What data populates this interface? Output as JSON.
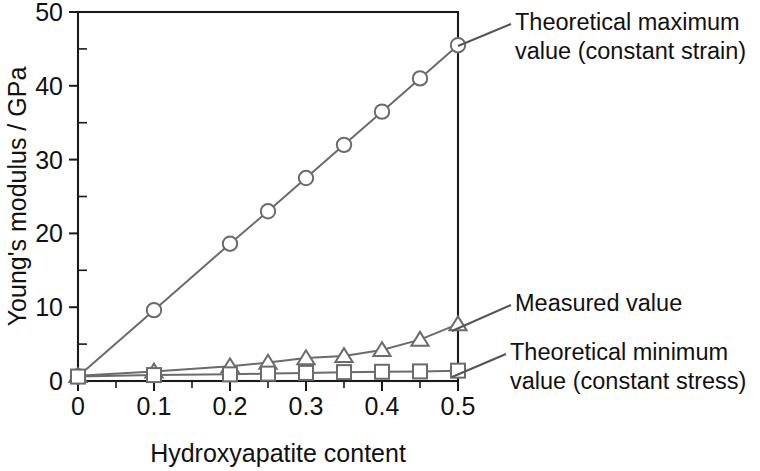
{
  "chart_data": {
    "type": "line",
    "title": "",
    "xlabel": "Hydroxyapatite content",
    "ylabel": "Young's modulus / GPa",
    "xlim": [
      0,
      0.5
    ],
    "ylim": [
      0,
      50
    ],
    "xticks": [
      "0",
      "0.1",
      "0.2",
      "0.3",
      "0.4",
      "0.5"
    ],
    "xtick_values": [
      0,
      0.1,
      0.2,
      0.3,
      0.4,
      0.5
    ],
    "xminor_step": 0.05,
    "yticks": [
      "0",
      "10",
      "20",
      "30",
      "40",
      "50"
    ],
    "ytick_values": [
      0,
      10,
      20,
      30,
      40,
      50
    ],
    "yminor_step": 5,
    "grid": false,
    "legend_position": "annotations-right",
    "series": [
      {
        "name": "Theoretical maximum value (constant strain)",
        "marker": "circle",
        "x": [
          0,
          0.1,
          0.2,
          0.25,
          0.3,
          0.35,
          0.4,
          0.45,
          0.5
        ],
        "values": [
          0.6,
          9.6,
          18.6,
          23.0,
          27.5,
          32.0,
          36.5,
          41.0,
          45.5
        ]
      },
      {
        "name": "Measured value",
        "marker": "triangle",
        "x": [
          0,
          0.1,
          0.2,
          0.25,
          0.3,
          0.35,
          0.4,
          0.45,
          0.5
        ],
        "values": [
          0.7,
          1.3,
          2.0,
          2.5,
          3.1,
          3.4,
          4.2,
          5.6,
          7.7
        ]
      },
      {
        "name": "Theoretical minimum value (constant stress)",
        "marker": "square",
        "x": [
          0,
          0.1,
          0.2,
          0.25,
          0.3,
          0.35,
          0.4,
          0.45,
          0.5
        ],
        "values": [
          0.6,
          0.8,
          0.9,
          1.0,
          1.1,
          1.2,
          1.25,
          1.3,
          1.4
        ]
      }
    ],
    "annotations": [
      {
        "id": "theoretical-maximum",
        "lines": [
          "Theoretical maximum",
          "value (constant strain)"
        ],
        "text": "Theoretical maximum value (constant strain)",
        "label_x": 515,
        "label_y": 22,
        "leader_from": [
          458,
          46
        ],
        "leader_to": [
          511,
          24
        ]
      },
      {
        "id": "measured-value",
        "lines": [
          "Measured value"
        ],
        "text": "Measured value",
        "label_x": 515,
        "label_y": 303,
        "leader_from": [
          452,
          331
        ],
        "leader_to": [
          511,
          305
        ]
      },
      {
        "id": "theoretical-minimum",
        "lines": [
          "Theoretical minimum",
          "value (constant stress)"
        ],
        "text": "Theoretical minimum value (constant stress)",
        "label_x": 510,
        "label_y": 352,
        "leader_from": [
          452,
          377
        ],
        "leader_to": [
          506,
          354
        ]
      }
    ],
    "colors": {
      "axis": "#1a1a1a",
      "series_line": "#6b6b6b",
      "marker_fill": "#ffffff",
      "text": "#111111",
      "background": "#ffffff"
    }
  },
  "axes": {
    "y_title": "Young's modulus / GPa",
    "x_title": "Hydroxyapatite content"
  }
}
